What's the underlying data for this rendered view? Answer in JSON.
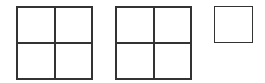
{
  "diagram": {
    "title": "",
    "line_color": "#333333",
    "shapes": [
      {
        "id": "grid-a",
        "rows": 2,
        "cols": 2,
        "x": 16,
        "y": 6,
        "w": 77,
        "h": 74
      },
      {
        "id": "grid-b",
        "rows": 2,
        "cols": 2,
        "x": 115,
        "y": 6,
        "w": 77,
        "h": 74
      },
      {
        "id": "grid-c",
        "rows": 1,
        "cols": 1,
        "x": 214,
        "y": 6,
        "w": 39,
        "h": 37
      }
    ]
  }
}
